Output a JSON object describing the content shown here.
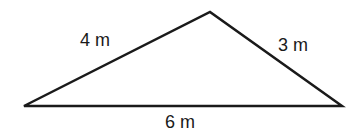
{
  "diagram": {
    "shape": "triangle",
    "sides": [
      {
        "id": "left",
        "label": "4 m",
        "length": 4,
        "unit": "m"
      },
      {
        "id": "right",
        "label": "3 m",
        "length": 3,
        "unit": "m"
      },
      {
        "id": "base",
        "label": "6 m",
        "length": 6,
        "unit": "m"
      }
    ],
    "stroke_color": "#1a1a1a"
  }
}
